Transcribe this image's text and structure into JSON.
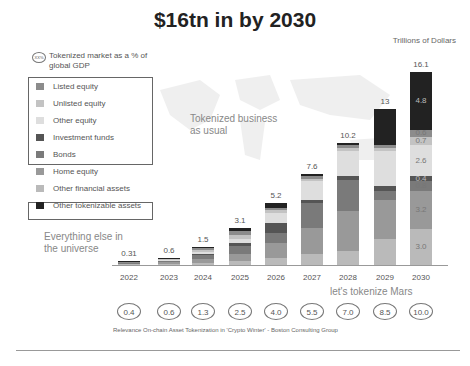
{
  "title": "$16tn in by 2030",
  "units": "Trillions of Dollars",
  "gdp_key": {
    "oval": "XX%",
    "text": "Tokenized market as a % of global GDP"
  },
  "legend": [
    {
      "label": "Listed equity",
      "color": "#8c8c8c",
      "boxed": 1
    },
    {
      "label": "Unlisted equity",
      "color": "#c3c3c3",
      "boxed": 1
    },
    {
      "label": "Other equity",
      "color": "#dedede",
      "boxed": 1
    },
    {
      "label": "Investment funds",
      "color": "#555555",
      "boxed": 1
    },
    {
      "label": "Bonds",
      "color": "#7a7a7a",
      "boxed": 1
    },
    {
      "label": "Home equity",
      "color": "#999999",
      "boxed": 0
    },
    {
      "label": "Other financial assets",
      "color": "#bababa",
      "boxed": 0
    },
    {
      "label": "Other tokenizable assets",
      "color": "#222222",
      "boxed": 2
    }
  ],
  "annotations": {
    "business_as_usual": "Tokenized business as usual",
    "everything_else": "Everything else in the universe",
    "mars": "let's tokenize Mars"
  },
  "source": "Relevance On-chain Asset Tokenization in 'Crypto Winter' - Boston Consulting Group",
  "chart_data": {
    "type": "bar",
    "stacked": true,
    "title": "$16tn in by 2030",
    "ylabel": "Trillions of Dollars",
    "xlabel": "",
    "categories": [
      "2022",
      "2023",
      "2024",
      "2025",
      "2026",
      "2027",
      "2028",
      "2029",
      "2030"
    ],
    "totals": [
      0.31,
      0.6,
      1.5,
      3.1,
      5.2,
      7.6,
      10.2,
      13.0,
      16.1
    ],
    "gdp_percent": [
      0.4,
      0.6,
      1.3,
      2.5,
      4.0,
      5.5,
      7.0,
      8.5,
      10.0
    ],
    "stack_order_bottom_to_top": [
      "Other financial assets",
      "Home equity",
      "Bonds",
      "Investment funds",
      "Other equity",
      "Unlisted equity",
      "Listed equity",
      "Other tokenizable assets"
    ],
    "series": [
      {
        "name": "Other financial assets",
        "color": "#bababa",
        "values": [
          0.05,
          0.1,
          0.2,
          0.3,
          0.6,
          0.9,
          1.2,
          2.2,
          3.0
        ]
      },
      {
        "name": "Home equity",
        "color": "#999999",
        "values": [
          0.08,
          0.15,
          0.3,
          0.6,
          1.2,
          2.2,
          3.3,
          3.2,
          3.2
        ]
      },
      {
        "name": "Bonds",
        "color": "#7a7a7a",
        "values": [
          0.05,
          0.1,
          0.3,
          0.7,
          0.9,
          2.1,
          2.6,
          0.8,
          0.8
        ]
      },
      {
        "name": "Investment funds",
        "color": "#555555",
        "values": [
          0.03,
          0.05,
          0.15,
          0.2,
          0.8,
          0.2,
          0.3,
          0.4,
          0.4
        ]
      },
      {
        "name": "Other equity",
        "color": "#dedede",
        "values": [
          0.03,
          0.05,
          0.15,
          0.4,
          0.8,
          1.6,
          2.1,
          2.9,
          2.6
        ]
      },
      {
        "name": "Unlisted equity",
        "color": "#c3c3c3",
        "values": [
          0.02,
          0.05,
          0.15,
          0.3,
          0.3,
          0.2,
          0.3,
          0.3,
          0.7
        ]
      },
      {
        "name": "Listed equity",
        "color": "#8c8c8c",
        "values": [
          0.02,
          0.05,
          0.15,
          0.3,
          0.2,
          0.2,
          0.2,
          0.2,
          0.6
        ]
      },
      {
        "name": "Other tokenizable assets",
        "color": "#222222",
        "values": [
          0.03,
          0.05,
          0.1,
          0.3,
          0.4,
          0.2,
          0.2,
          3.0,
          4.8
        ]
      }
    ],
    "segment_labels_2030": [
      "3.0",
      "3.2",
      "0.8",
      "0.4",
      "2.6",
      "0.7",
      "0.6",
      "4.8"
    ],
    "ylim": [
      0,
      16.1
    ],
    "grid": false,
    "legend_position": "left"
  }
}
